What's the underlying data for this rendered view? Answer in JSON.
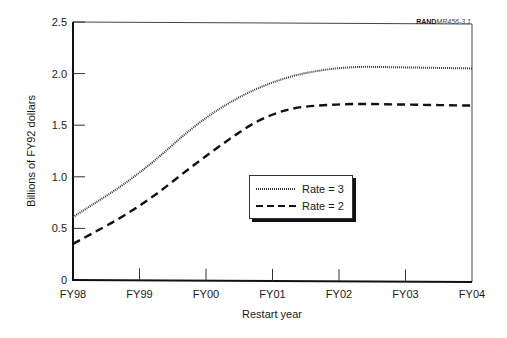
{
  "source_tag": {
    "bold": "RAND",
    "italic": "MR456-3.1"
  },
  "chart_data": {
    "type": "line",
    "title": "",
    "xlabel": "Restart year",
    "ylabel": "Billions of FY92 dollars",
    "categories": [
      "FY98",
      "FY99",
      "FY00",
      "FY01",
      "FY02",
      "FY03",
      "FY04"
    ],
    "series": [
      {
        "name": "Rate = 3",
        "style": "dotted",
        "values": [
          0.61,
          1.02,
          1.6,
          1.94,
          2.07,
          2.06,
          2.05
        ]
      },
      {
        "name": "Rate = 2",
        "style": "dashed",
        "values": [
          0.35,
          0.7,
          1.21,
          1.65,
          1.71,
          1.7,
          1.69
        ]
      }
    ],
    "yticks": [
      "0",
      "0.5",
      "1.0",
      "1.5",
      "2.0",
      "2.5"
    ],
    "ylim": [
      0,
      2.5
    ],
    "grid": false,
    "legend_position": "center-right inside plot"
  },
  "legend": {
    "items": [
      {
        "label": "Rate = 3"
      },
      {
        "label": "Rate = 2"
      }
    ]
  }
}
